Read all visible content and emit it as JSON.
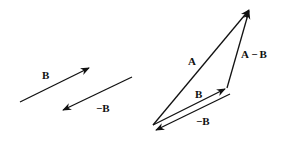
{
  "diagram": {
    "labels": {
      "b_left": "B",
      "neg_b_left": "−B",
      "a": "A",
      "a_minus_b": "A − B",
      "b_right": "B",
      "neg_b_right": "−B"
    },
    "colors": {
      "stroke": "#111111",
      "background": "#ffffff"
    }
  }
}
